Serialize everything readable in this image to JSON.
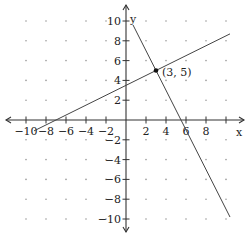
{
  "chart_data": {
    "type": "line",
    "title": "",
    "xlabel": "x",
    "ylabel": "y",
    "xlim": [
      -10,
      10
    ],
    "ylim": [
      -10,
      10
    ],
    "grid": "dotted points every 2 units",
    "x_ticks": [
      -10,
      -8,
      -6,
      -4,
      -2,
      2,
      4,
      6,
      8
    ],
    "y_ticks": [
      10,
      8,
      6,
      4,
      2,
      -2,
      -4,
      -6,
      -8,
      -10
    ],
    "series": [
      {
        "name": "steep line",
        "equation": "y = -2x + 11",
        "x": [
          0.7,
          10.4
        ],
        "y": [
          9.6,
          -9.8
        ]
      },
      {
        "name": "shallow line",
        "equation": "y = 0.5x + 3.5",
        "x": [
          -9.2,
          10.4
        ],
        "y": [
          -1.1,
          8.7
        ]
      }
    ],
    "annotations": [
      {
        "type": "point",
        "x": 3,
        "y": 5,
        "label": "(3, 5)"
      }
    ]
  },
  "labels": {
    "x_axis": "x",
    "y_axis": "y",
    "intersection": "(3, 5)"
  }
}
